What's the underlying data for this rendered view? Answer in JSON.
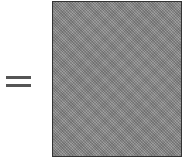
{
  "diagram": {
    "operator": {
      "symbol": "=",
      "icon": "equals-icon",
      "color": "#555555"
    },
    "shape": {
      "type": "rectangle",
      "fill": "#8a8a8a",
      "pattern": "stippled-gray",
      "border": "#333333"
    }
  }
}
